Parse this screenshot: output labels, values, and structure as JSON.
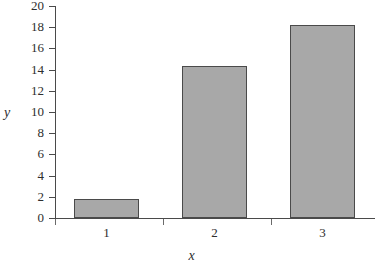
{
  "chart_data": {
    "type": "bar",
    "title": "",
    "xlabel": "x",
    "ylabel": "y",
    "categories": [
      "1",
      "2",
      "3"
    ],
    "values": [
      1.8,
      14.3,
      18.2
    ],
    "ylim": [
      0,
      20
    ],
    "ytick_labels": [
      "0",
      "2",
      "4",
      "6",
      "8",
      "10",
      "12",
      "14",
      "16",
      "18",
      "20"
    ],
    "ytick_values": [
      0,
      2,
      4,
      6,
      8,
      10,
      12,
      14,
      16,
      18,
      20
    ],
    "xtick_labels": [
      "1",
      "2",
      "3"
    ],
    "grid": false,
    "legend": null,
    "bar_fill_color": "#a8a8a8",
    "bar_border_color": "#4a4a4a",
    "axis_color": "#4a4a4a",
    "background_color": "#ffffff"
  }
}
